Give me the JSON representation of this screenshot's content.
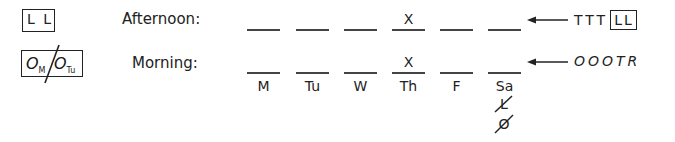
{
  "legend": {
    "afternoon_code": "L L",
    "morning_code": {
      "left": "O",
      "left_sub": "M",
      "right": "O",
      "right_sub": "Tu"
    }
  },
  "rows": [
    {
      "label": "Afternoon:",
      "marks": [
        "",
        "",
        "",
        "X",
        "",
        ""
      ],
      "sequence_text": "TTT",
      "sequence_boxed": "LL"
    },
    {
      "label": "Morning:",
      "marks": [
        "",
        "",
        "",
        "X",
        "",
        ""
      ],
      "sequence_text": "OOOTR",
      "sequence_boxed": ""
    }
  ],
  "days": [
    "M",
    "Tu",
    "W",
    "Th",
    "F",
    "Sa"
  ],
  "eliminated_under_saturday": [
    {
      "letter": "L",
      "struck": true
    },
    {
      "letter": "O",
      "struck": true
    }
  ],
  "colors": {
    "ink": "#222222",
    "background": "#ffffff"
  }
}
